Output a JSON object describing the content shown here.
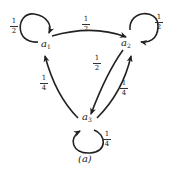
{
  "diagram": {
    "type": "state-transition-graph",
    "caption": "(a)",
    "nodes": [
      {
        "id": "a1",
        "base": "a",
        "sub": "1"
      },
      {
        "id": "a2",
        "base": "a",
        "sub": "2"
      },
      {
        "id": "a3",
        "base": "a",
        "sub": "3"
      }
    ],
    "edges": [
      {
        "from": "a1",
        "to": "a1",
        "num": "1",
        "den": "2"
      },
      {
        "from": "a1",
        "to": "a2",
        "num": "1",
        "den": "2"
      },
      {
        "from": "a2",
        "to": "a2",
        "num": "1",
        "den": "2"
      },
      {
        "from": "a2",
        "to": "a3",
        "num": "1",
        "den": "2"
      },
      {
        "from": "a3",
        "to": "a2",
        "num": "1",
        "den": "4"
      },
      {
        "from": "a3",
        "to": "a1",
        "num": "1",
        "den": "4"
      },
      {
        "from": "a3",
        "to": "a3",
        "num": "1",
        "den": "4"
      }
    ]
  }
}
